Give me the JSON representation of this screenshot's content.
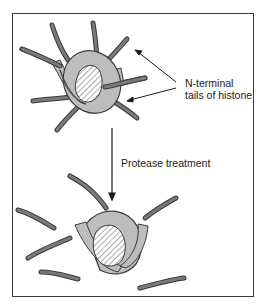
{
  "diagram": {
    "labels": {
      "tails_line1": "N-terminal",
      "tails_line2": "tails of histone",
      "treatment": "Protease treatment"
    },
    "colors": {
      "histone_fill": "#bdbdbd",
      "tail_fill": "#7a7a7a",
      "outline": "#3a3a3a",
      "hatch": "#555555"
    }
  }
}
